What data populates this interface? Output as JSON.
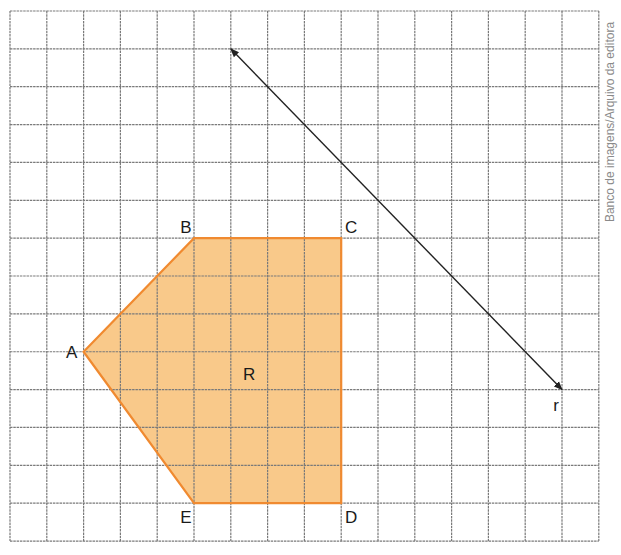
{
  "grid": {
    "origin_x": 10,
    "origin_y": 11,
    "cols": 16,
    "rows": 14,
    "cell_w": 36.8,
    "cell_h": 37.86,
    "line_color": "#7a7a7a"
  },
  "polygon": {
    "name": "R",
    "fill": "#F9C98A",
    "stroke": "#F08A30",
    "vertices": [
      {
        "label": "A",
        "col": 2,
        "row": 9,
        "label_dx": -12,
        "label_dy": 6
      },
      {
        "label": "B",
        "col": 5,
        "row": 6,
        "label_dx": -8,
        "label_dy": -5
      },
      {
        "label": "C",
        "col": 9,
        "row": 6,
        "label_dx": 10,
        "label_dy": -5
      },
      {
        "label": "D",
        "col": 9,
        "row": 13,
        "label_dx": 10,
        "label_dy": 20
      },
      {
        "label": "E",
        "col": 5,
        "row": 13,
        "label_dx": -8,
        "label_dy": 20
      }
    ],
    "region_label": {
      "text": "R",
      "col": 6.5,
      "row": 9.6
    }
  },
  "line_r": {
    "label": "r",
    "start": {
      "col": 6,
      "row": 1
    },
    "end": {
      "col": 15,
      "row": 10
    },
    "label_offset": {
      "dx": -6,
      "dy": 21
    },
    "color": "#222222"
  },
  "credit": "Banco de imagens/Arquivo da editora"
}
